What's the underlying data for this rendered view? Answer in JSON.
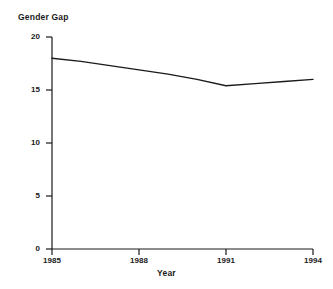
{
  "chart_data": {
    "type": "line",
    "title": "Gender Gap",
    "xlabel": "Year",
    "ylabel": "",
    "x": [
      1985,
      1986,
      1987,
      1988,
      1989,
      1990,
      1991,
      1992,
      1993,
      1994
    ],
    "values": [
      18.0,
      17.7,
      17.3,
      16.9,
      16.5,
      16.0,
      15.4,
      15.6,
      15.8,
      16.0
    ],
    "series": [
      {
        "name": "Gender Gap",
        "values": [
          18.0,
          17.7,
          17.3,
          16.9,
          16.5,
          16.0,
          15.4,
          15.6,
          15.8,
          16.0
        ]
      }
    ],
    "xlim": [
      1985,
      1994
    ],
    "ylim": [
      0,
      20
    ],
    "xticks": [
      1985,
      1988,
      1991,
      1994
    ],
    "xtick_labels": [
      "1985",
      "1988",
      "1991",
      "1994"
    ],
    "yticks": [
      0,
      5,
      10,
      15,
      20
    ],
    "ytick_labels": [
      "0",
      "5",
      "10",
      "15",
      "20"
    ],
    "grid": false,
    "legend": false,
    "line_color": "#1a1a1a",
    "axis_color": "#1a1a1a",
    "background": "#ffffff"
  }
}
